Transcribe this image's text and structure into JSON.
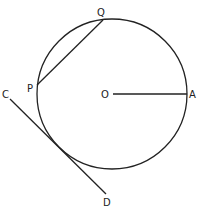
{
  "diagram": {
    "type": "circle-geometry",
    "circle": {
      "center_label": "O",
      "cx": 112,
      "cy": 94,
      "r": 75
    },
    "points": {
      "O": {
        "label": "O",
        "x": 112,
        "y": 94
      },
      "A": {
        "label": "A",
        "x": 187,
        "y": 94
      },
      "P": {
        "label": "P",
        "x": 37,
        "y": 85
      },
      "Q": {
        "label": "Q",
        "x": 103,
        "y": 20
      },
      "C": {
        "label": "C",
        "x": 10,
        "y": 99
      },
      "D": {
        "label": "D",
        "x": 106,
        "y": 194
      }
    },
    "segments": [
      {
        "name": "radius OA",
        "from": "O",
        "to": "A"
      },
      {
        "name": "chord PQ",
        "from": "P",
        "to": "Q"
      },
      {
        "name": "tangent CD",
        "from": "C",
        "to": "D"
      }
    ],
    "stroke_color": "#222222"
  }
}
